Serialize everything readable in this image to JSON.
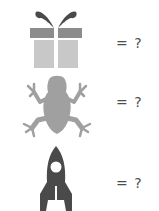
{
  "puzzle": {
    "rows": [
      {
        "icon": "gift-icon",
        "label": "= ?",
        "colors": {
          "bow": "#4a4a4a",
          "lid": "#8c8c8c",
          "box": "#c8c8c8"
        }
      },
      {
        "icon": "frog-icon",
        "label": "= ?",
        "colors": {
          "body": "#a0a0a0"
        }
      },
      {
        "icon": "rocket-icon",
        "label": "= ?",
        "colors": {
          "body": "#4a4a4a"
        }
      }
    ]
  }
}
